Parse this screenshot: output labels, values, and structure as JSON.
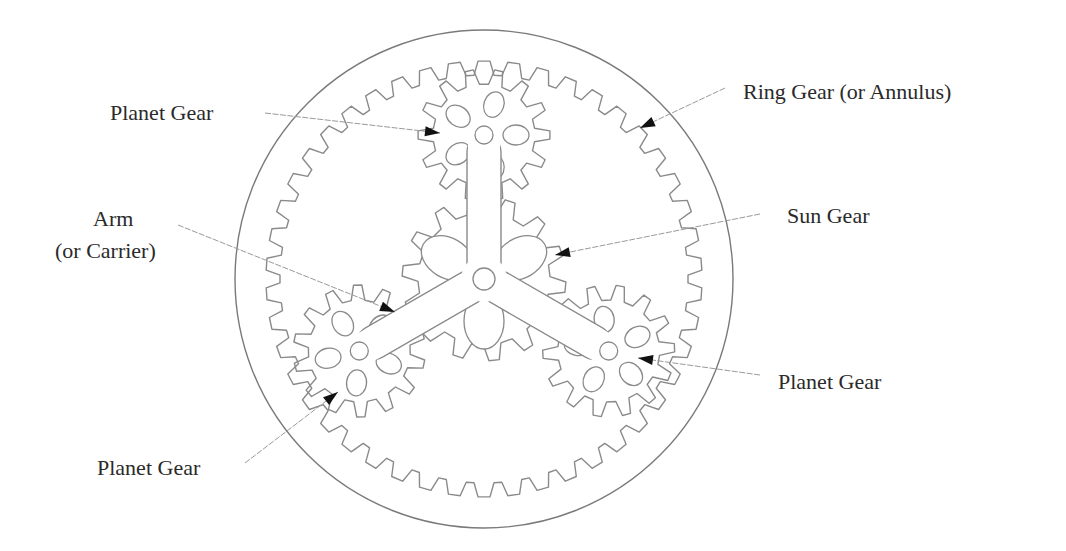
{
  "diagram": {
    "colors": {
      "line": "#8a8a8a",
      "arrow": "#111111",
      "text": "#2a2a2a",
      "background": "#ffffff"
    },
    "center": [
      484,
      279
    ],
    "housing_radius": 249,
    "ring_gear": {
      "teeth": 46,
      "root_radius": 218,
      "tip_radius": 204
    },
    "sun_gear": {
      "teeth": 14,
      "tip_radius": 82,
      "root_radius": 66
    },
    "planet_gears": {
      "teeth": 14,
      "tip_radius": 66,
      "root_radius": 51,
      "pivot_distance": 144,
      "angles_deg": [
        -90,
        150,
        30
      ]
    },
    "arm": {
      "width": 34,
      "hub_hole_radius": 11,
      "pivot_hole_radius": 9
    }
  },
  "labels": {
    "planet_top": "Planet Gear",
    "ring": "Ring Gear (or Annulus)",
    "sun": "Sun Gear",
    "arm_line1": "Arm",
    "arm_line2": "(or Carrier)",
    "planet_right": "Planet Gear",
    "planet_bottom_left": "Planet Gear"
  },
  "leaders": [
    {
      "name": "planet-top-leader",
      "from": [
        265,
        113
      ],
      "to": [
        440,
        133
      ]
    },
    {
      "name": "ring-leader",
      "from": [
        725,
        88
      ],
      "to": [
        640,
        128
      ]
    },
    {
      "name": "sun-leader",
      "from": [
        760,
        214
      ],
      "to": [
        555,
        255
      ]
    },
    {
      "name": "arm-leader",
      "from": [
        178,
        225
      ],
      "to": [
        395,
        312
      ]
    },
    {
      "name": "planet-right-leader",
      "from": [
        760,
        375
      ],
      "to": [
        638,
        358
      ]
    },
    {
      "name": "planet-bottom-left-leader",
      "from": [
        245,
        463
      ],
      "to": [
        338,
        392
      ]
    }
  ]
}
